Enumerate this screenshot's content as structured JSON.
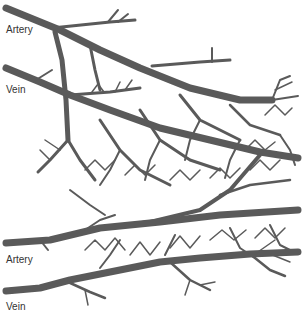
{
  "diagram": {
    "type": "vascular-network",
    "vessel_color": "#5a5a5a",
    "background": "#ffffff",
    "labels": [
      {
        "id": "artery-top",
        "text": "Artery",
        "x": 6,
        "y": 25
      },
      {
        "id": "vein-top",
        "text": "Vein",
        "x": 6,
        "y": 85
      },
      {
        "id": "artery-bottom",
        "text": "Artery",
        "x": 6,
        "y": 255
      },
      {
        "id": "vein-bottom",
        "text": "Vein",
        "x": 6,
        "y": 302
      }
    ]
  }
}
